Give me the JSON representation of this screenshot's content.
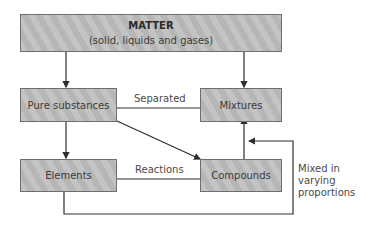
{
  "diagram": {
    "nodes": {
      "matter": {
        "title": "MATTER",
        "subtitle": "(solid, liquids and gases)"
      },
      "pure": {
        "label": "Pure substances"
      },
      "mixtures": {
        "label": "Mixtures"
      },
      "elements": {
        "label": "Elements"
      },
      "compounds": {
        "label": "Compounds"
      }
    },
    "edges": {
      "separated": "Separated",
      "reactions": "Reactions",
      "mixed_line1": "Mixed in",
      "mixed_line2": "varying",
      "mixed_line3": "proportions"
    },
    "colors": {
      "box_fill": "#bdbdbd",
      "box_border": "#6e6e6e",
      "line": "#2e2e2e"
    }
  }
}
